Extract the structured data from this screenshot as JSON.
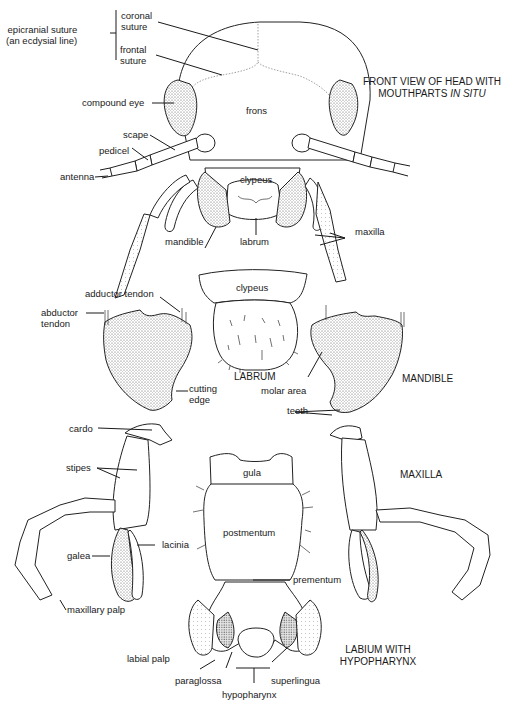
{
  "figure": {
    "panels": [
      {
        "id": "head",
        "title_line1": "FRONT VIEW OF HEAD WITH",
        "title_line2_plain": "MOUTHPARTS ",
        "title_line2_italic": "IN SITU",
        "labels": {
          "epicranial_suture_1": "epicranial suture",
          "epicranial_suture_2": "(an ecdysial line)",
          "coronal_suture_1": "coronal",
          "coronal_suture_2": "suture",
          "frontal_suture_1": "frontal",
          "frontal_suture_2": "suture",
          "compound_eye": "compound eye",
          "frons": "frons",
          "scape": "scape",
          "pedicel": "pedicel",
          "antenna": "antenna",
          "clypeus": "clypeus",
          "mandible": "mandible",
          "labrum": "labrum",
          "maxilla": "maxilla"
        }
      },
      {
        "id": "labrum",
        "title": "LABRUM",
        "labels": {
          "clypeus": "clypeus"
        }
      },
      {
        "id": "mandible",
        "title": "MANDIBLE",
        "labels": {
          "adductor_tendon": "adductor tendon",
          "abductor_tendon_1": "abductor",
          "abductor_tendon_2": "tendon",
          "cutting_edge_1": "cutting",
          "cutting_edge_2": "edge",
          "molar_area": "molar area",
          "teeth": "teeth"
        }
      },
      {
        "id": "maxilla",
        "title": "MAXILLA",
        "labels": {
          "cardo": "cardo",
          "stipes": "stipes",
          "galea": "galea",
          "lacinia": "lacinia",
          "maxillary_palp": "maxillary palp"
        }
      },
      {
        "id": "labium",
        "title_line1": "LABIUM WITH",
        "title_line2": "HYPOPHARYNX",
        "labels": {
          "gula": "gula",
          "postmentum": "postmentum",
          "prementum": "prementum",
          "labial_palp": "labial palp",
          "paraglossa": "paraglossa",
          "superlingua": "superlingua",
          "hypopharynx": "hypopharynx"
        }
      }
    ],
    "colors": {
      "ink": "#1a1a1a",
      "stipple": "#777777",
      "background": "#ffffff"
    }
  }
}
